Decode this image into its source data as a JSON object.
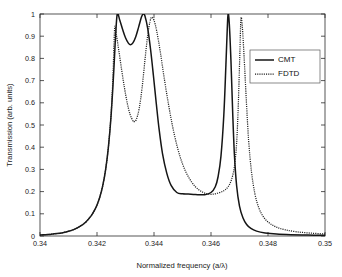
{
  "chart_data": {
    "type": "line",
    "title": "",
    "xlabel": "Normalized frequency (a/λ)",
    "ylabel": "Transmission (arb. units)",
    "xlim": [
      0.34,
      0.35
    ],
    "ylim": [
      0,
      1
    ],
    "grid": false,
    "legend_position": "upper-right",
    "xticks": [
      "0.34",
      "0.342",
      "0.344",
      "0.346",
      "0.348",
      "0.35"
    ],
    "xtick_values": [
      0.34,
      0.342,
      0.344,
      0.346,
      0.348,
      0.35
    ],
    "yticks": [
      "0",
      "0.1",
      "0.2",
      "0.3",
      "0.4",
      "0.5",
      "0.6",
      "0.7",
      "0.8",
      "0.9",
      "1"
    ],
    "ytick_values": [
      0,
      0.1,
      0.2,
      0.3,
      0.4,
      0.5,
      0.6,
      0.7,
      0.8,
      0.9,
      1
    ],
    "series": [
      {
        "name": "CMT",
        "style": "solid",
        "color": "#151515",
        "peaks": [
          {
            "x": 0.34271,
            "y": 1.0
          },
          {
            "x": 0.34362,
            "y": 1.0
          },
          {
            "x": 0.3466,
            "y": 1.0
          }
        ],
        "valleys": [
          {
            "x": 0.34318,
            "y": 0.862
          },
          {
            "x": 0.34578,
            "y": 0.186
          }
        ],
        "points": [
          [
            0.34,
            0.004
          ],
          [
            0.3402,
            0.006
          ],
          [
            0.3404,
            0.008
          ],
          [
            0.3406,
            0.011
          ],
          [
            0.3408,
            0.015
          ],
          [
            0.341,
            0.021
          ],
          [
            0.3412,
            0.03
          ],
          [
            0.3414,
            0.043
          ],
          [
            0.3416,
            0.062
          ],
          [
            0.3418,
            0.092
          ],
          [
            0.3419,
            0.113
          ],
          [
            0.342,
            0.14
          ],
          [
            0.3421,
            0.176
          ],
          [
            0.3422,
            0.226
          ],
          [
            0.3423,
            0.297
          ],
          [
            0.3424,
            0.4
          ],
          [
            0.3425,
            0.552
          ],
          [
            0.3426,
            0.77
          ],
          [
            0.34265,
            0.895
          ],
          [
            0.34271,
            1.0
          ],
          [
            0.3428,
            0.972
          ],
          [
            0.3429,
            0.93
          ],
          [
            0.343,
            0.893
          ],
          [
            0.3431,
            0.869
          ],
          [
            0.34318,
            0.862
          ],
          [
            0.34326,
            0.87
          ],
          [
            0.34336,
            0.898
          ],
          [
            0.34346,
            0.941
          ],
          [
            0.34356,
            0.986
          ],
          [
            0.34362,
            1.0
          ],
          [
            0.34368,
            0.992
          ],
          [
            0.34378,
            0.934
          ],
          [
            0.34388,
            0.84
          ],
          [
            0.34398,
            0.722
          ],
          [
            0.34408,
            0.597
          ],
          [
            0.34418,
            0.48
          ],
          [
            0.3443,
            0.37
          ],
          [
            0.34445,
            0.282
          ],
          [
            0.3446,
            0.228
          ],
          [
            0.3448,
            0.196
          ],
          [
            0.345,
            0.19
          ],
          [
            0.3452,
            0.189
          ],
          [
            0.34545,
            0.187
          ],
          [
            0.34578,
            0.186
          ],
          [
            0.346,
            0.196
          ],
          [
            0.34615,
            0.222
          ],
          [
            0.34625,
            0.268
          ],
          [
            0.34635,
            0.36
          ],
          [
            0.34645,
            0.545
          ],
          [
            0.34652,
            0.76
          ],
          [
            0.34657,
            0.93
          ],
          [
            0.3466,
            1.0
          ],
          [
            0.34664,
            0.96
          ],
          [
            0.3467,
            0.79
          ],
          [
            0.34676,
            0.56
          ],
          [
            0.34682,
            0.37
          ],
          [
            0.3469,
            0.225
          ],
          [
            0.347,
            0.135
          ],
          [
            0.34712,
            0.082
          ],
          [
            0.34725,
            0.052
          ],
          [
            0.3474,
            0.034
          ],
          [
            0.3476,
            0.022
          ],
          [
            0.3479,
            0.014
          ],
          [
            0.3483,
            0.009
          ],
          [
            0.3488,
            0.006
          ],
          [
            0.3494,
            0.004
          ],
          [
            0.35,
            0.003
          ]
        ]
      },
      {
        "name": "FDTD",
        "style": "dotted",
        "color": "#202020",
        "peaks": [
          {
            "x": 0.34262,
            "y": 0.935
          },
          {
            "x": 0.34392,
            "y": 0.985
          },
          {
            "x": 0.34705,
            "y": 0.978
          }
        ],
        "valleys": [
          {
            "x": 0.3433,
            "y": 0.515
          },
          {
            "x": 0.34595,
            "y": 0.188
          }
        ],
        "points": [
          [
            0.34,
            0.004
          ],
          [
            0.3402,
            0.006
          ],
          [
            0.3404,
            0.008
          ],
          [
            0.3406,
            0.011
          ],
          [
            0.3408,
            0.015
          ],
          [
            0.341,
            0.021
          ],
          [
            0.3412,
            0.03
          ],
          [
            0.3414,
            0.043
          ],
          [
            0.3416,
            0.062
          ],
          [
            0.3418,
            0.092
          ],
          [
            0.3419,
            0.113
          ],
          [
            0.342,
            0.14
          ],
          [
            0.3421,
            0.176
          ],
          [
            0.3422,
            0.226
          ],
          [
            0.3423,
            0.297
          ],
          [
            0.3424,
            0.4
          ],
          [
            0.3425,
            0.56
          ],
          [
            0.34256,
            0.72
          ],
          [
            0.34262,
            0.935
          ],
          [
            0.34268,
            0.905
          ],
          [
            0.34276,
            0.84
          ],
          [
            0.34286,
            0.752
          ],
          [
            0.34296,
            0.67
          ],
          [
            0.34306,
            0.6
          ],
          [
            0.34316,
            0.548
          ],
          [
            0.34326,
            0.519
          ],
          [
            0.3433,
            0.515
          ],
          [
            0.34338,
            0.525
          ],
          [
            0.34348,
            0.574
          ],
          [
            0.34358,
            0.665
          ],
          [
            0.34368,
            0.79
          ],
          [
            0.34378,
            0.905
          ],
          [
            0.34386,
            0.966
          ],
          [
            0.34392,
            0.985
          ],
          [
            0.344,
            0.972
          ],
          [
            0.3441,
            0.92
          ],
          [
            0.34422,
            0.83
          ],
          [
            0.34435,
            0.718
          ],
          [
            0.3445,
            0.6
          ],
          [
            0.34465,
            0.495
          ],
          [
            0.34482,
            0.4
          ],
          [
            0.345,
            0.325
          ],
          [
            0.3452,
            0.268
          ],
          [
            0.34545,
            0.222
          ],
          [
            0.3457,
            0.198
          ],
          [
            0.34595,
            0.188
          ],
          [
            0.3462,
            0.192
          ],
          [
            0.34645,
            0.204
          ],
          [
            0.3466,
            0.222
          ],
          [
            0.34672,
            0.254
          ],
          [
            0.34682,
            0.312
          ],
          [
            0.3469,
            0.42
          ],
          [
            0.34696,
            0.6
          ],
          [
            0.34701,
            0.81
          ],
          [
            0.34705,
            0.978
          ],
          [
            0.3471,
            0.94
          ],
          [
            0.34716,
            0.81
          ],
          [
            0.34724,
            0.61
          ],
          [
            0.34732,
            0.43
          ],
          [
            0.34742,
            0.29
          ],
          [
            0.34754,
            0.19
          ],
          [
            0.34768,
            0.126
          ],
          [
            0.34785,
            0.084
          ],
          [
            0.34805,
            0.058
          ],
          [
            0.3483,
            0.04
          ],
          [
            0.3486,
            0.028
          ],
          [
            0.349,
            0.019
          ],
          [
            0.3495,
            0.013
          ],
          [
            0.35,
            0.009
          ]
        ]
      }
    ],
    "legend": [
      {
        "label": "CMT",
        "style": "solid"
      },
      {
        "label": "FDTD",
        "style": "dotted"
      }
    ]
  }
}
